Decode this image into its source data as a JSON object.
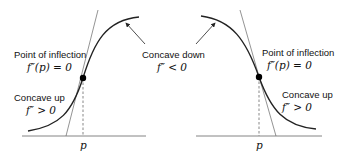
{
  "left": {
    "inflection_label": "Point of inflection",
    "inflection_eq": "f″(p) = 0",
    "concave_up_label": "Concave up",
    "concave_up_eq": "f″ > 0",
    "p_label": "p"
  },
  "center": {
    "concave_down_label": "Concave down",
    "concave_down_eq": "f″ < 0"
  },
  "right": {
    "inflection_label": "Point of inflection",
    "inflection_eq": "f″(p) = 0",
    "concave_up_label": "Concave up",
    "concave_up_eq": "f″ > 0",
    "p_label": "p"
  }
}
